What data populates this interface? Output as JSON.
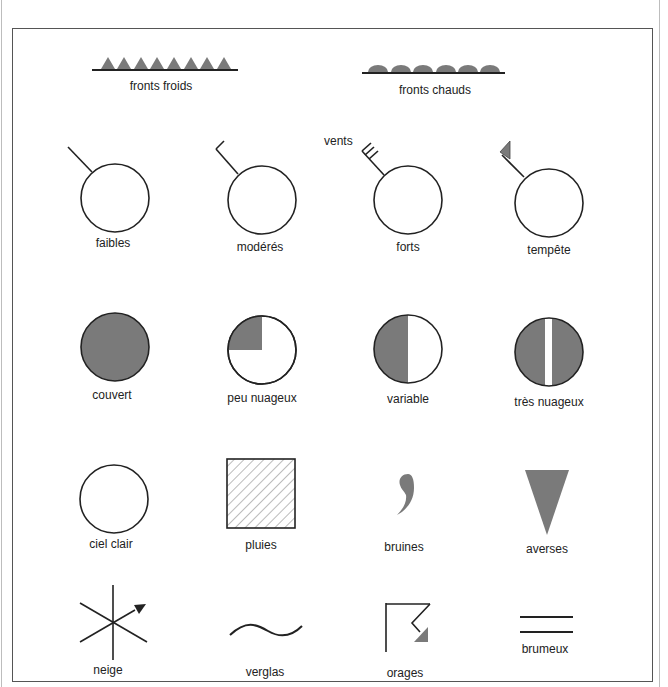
{
  "colors": {
    "fill_gray": "#7a7a7a",
    "stroke": "#222222",
    "frame": "#555555"
  },
  "fronts": {
    "cold": {
      "label": "fronts froids",
      "icon": "cold-front-triangles"
    },
    "warm": {
      "label": "fronts chauds",
      "icon": "warm-front-semicircles"
    }
  },
  "winds": {
    "caption": "vents",
    "items": [
      {
        "label": "faibles",
        "icon": "wind-light-icon"
      },
      {
        "label": "modérés",
        "icon": "wind-moderate-icon"
      },
      {
        "label": "forts",
        "icon": "wind-strong-icon"
      },
      {
        "label": "tempête",
        "icon": "wind-storm-icon"
      }
    ]
  },
  "cloud_cover": [
    {
      "label": "couvert",
      "icon": "overcast-icon"
    },
    {
      "label": "peu nuageux",
      "icon": "few-clouds-icon"
    },
    {
      "label": "variable",
      "icon": "variable-icon"
    },
    {
      "label": "très nuageux",
      "icon": "very-cloudy-icon"
    }
  ],
  "weather_row1": [
    {
      "label": "ciel clair",
      "icon": "clear-sky-icon"
    },
    {
      "label": "pluies",
      "icon": "rain-icon"
    },
    {
      "label": "bruines",
      "icon": "drizzle-icon"
    },
    {
      "label": "averses",
      "icon": "showers-icon"
    }
  ],
  "weather_row2": [
    {
      "label": "neige",
      "icon": "snow-icon"
    },
    {
      "label": "verglas",
      "icon": "ice-icon"
    },
    {
      "label": "orages",
      "icon": "thunderstorm-icon"
    },
    {
      "label": "brumeux",
      "icon": "mist-icon"
    }
  ]
}
